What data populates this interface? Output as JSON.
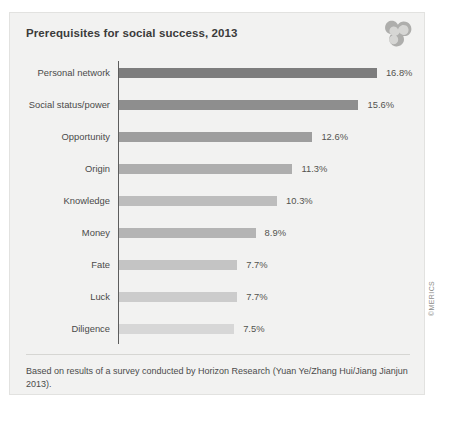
{
  "figure": {
    "title": "Prerequisites for social success, 2013",
    "logo_icon": "merics-swoosh-logo-icon",
    "footnote": "Based on results of a survey conducted by Horizon Research (Yuan Ye/Zhang Hui/Jiang Jianjun 2013).",
    "copyright": "©MERICS",
    "background_color": "#f2f2f1",
    "axis_color": "#5d5d5d"
  },
  "chart_data": {
    "type": "bar",
    "orientation": "horizontal",
    "title": "Prerequisites for social success, 2013",
    "xlabel": "",
    "ylabel": "",
    "xlim": [
      0,
      18
    ],
    "grid": false,
    "legend": false,
    "value_suffix": "%",
    "categories": [
      "Personal network",
      "Social status/power",
      "Opportunity",
      "Origin",
      "Knowledge",
      "Money",
      "Fate",
      "Luck",
      "Diligence"
    ],
    "values": [
      16.8,
      15.6,
      12.6,
      11.3,
      10.3,
      8.9,
      7.7,
      7.7,
      7.5
    ],
    "value_labels": [
      "16.8%",
      "15.6%",
      "12.6%",
      "11.3%",
      "10.3%",
      "8.9%",
      "7.7%",
      "7.7%",
      "7.5%"
    ],
    "bar_colors": [
      "#7d7d7d",
      "#8e8e8e",
      "#9e9e9e",
      "#aeaeae",
      "#bdbdbd",
      "#b4b4b4",
      "#c4c4c4",
      "#cccccc",
      "#d7d7d7"
    ]
  }
}
